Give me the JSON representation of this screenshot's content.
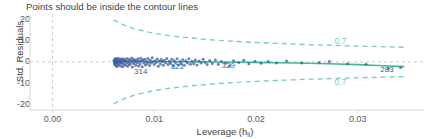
{
  "chart_data": {
    "type": "scatter",
    "title": "Points should be inside the contour lines",
    "xlabel_main": "Leverage (h",
    "xlabel_sub": "ii",
    "xlabel_close": ")",
    "xlabel": "Leverage (h_ii)",
    "ylabel": "Std. Residuals",
    "xlim": [
      -0.0022,
      0.0365
    ],
    "ylim": [
      -22.5,
      21.5
    ],
    "xticks": [
      0.0,
      0.01,
      0.02,
      0.03
    ],
    "xtick_labels": [
      "0.00",
      "0.01",
      "0.02",
      "0.03"
    ],
    "yticks": [
      20,
      10,
      0,
      -10,
      -20
    ],
    "ytick_labels": [
      "20",
      "10",
      "0",
      "-10",
      "-20"
    ],
    "grid": false,
    "legend": "none",
    "colors": {
      "point": "#3b5a9e",
      "smooth_line": "#3fbb93",
      "contour": "#7fcfb6",
      "reference_line": "#bdbdbd",
      "axis_text": "#5a5a5a",
      "background": "#ffffff"
    },
    "reference_lines": [
      {
        "orientation": "vertical",
        "value": 0.0,
        "style": "dashed",
        "color": "#c7c7c7"
      },
      {
        "orientation": "horizontal",
        "value": 0.0,
        "style": "dashed",
        "color": "#c7c7c7"
      }
    ],
    "annotations": [
      {
        "label": "0.7",
        "x": 0.0285,
        "y": 9.6,
        "color": "#7fcfb6"
      },
      {
        "label": "0.7",
        "x": 0.0285,
        "y": -9.6,
        "color": "#7fcfb6"
      },
      {
        "label": "314",
        "x": 0.0088,
        "y": -4.6,
        "color": "#3a5fa8"
      },
      {
        "label": "321",
        "x": 0.0124,
        "y": -2.3,
        "color": "#3a5fa8"
      },
      {
        "label": "329",
        "x": 0.0174,
        "y": -2.0,
        "color": "#3a5fa8"
      },
      {
        "label": "283",
        "x": 0.033,
        "y": -3.6,
        "color": "#3a5fa8"
      }
    ],
    "contours": {
      "label": "0.7",
      "style": "dashed",
      "upper": [
        [
          0.006,
          19.6
        ],
        [
          0.007,
          17.3
        ],
        [
          0.008,
          15.6
        ],
        [
          0.009,
          14.4
        ],
        [
          0.01,
          13.4
        ],
        [
          0.0115,
          12.3
        ],
        [
          0.013,
          11.5
        ],
        [
          0.0145,
          10.8
        ],
        [
          0.016,
          10.2
        ],
        [
          0.018,
          9.6
        ],
        [
          0.02,
          9.1
        ],
        [
          0.022,
          8.7
        ],
        [
          0.024,
          8.3
        ],
        [
          0.026,
          8.0
        ],
        [
          0.028,
          7.7
        ],
        [
          0.03,
          7.4
        ],
        [
          0.032,
          7.2
        ],
        [
          0.0345,
          6.9
        ]
      ],
      "lower": [
        [
          0.006,
          -19.6
        ],
        [
          0.007,
          -17.3
        ],
        [
          0.008,
          -15.6
        ],
        [
          0.009,
          -14.4
        ],
        [
          0.01,
          -13.4
        ],
        [
          0.0115,
          -12.3
        ],
        [
          0.013,
          -11.5
        ],
        [
          0.0145,
          -10.8
        ],
        [
          0.016,
          -10.2
        ],
        [
          0.018,
          -9.6
        ],
        [
          0.02,
          -9.1
        ],
        [
          0.022,
          -8.7
        ],
        [
          0.024,
          -8.3
        ],
        [
          0.026,
          -8.0
        ],
        [
          0.028,
          -7.7
        ],
        [
          0.03,
          -7.4
        ],
        [
          0.032,
          -7.2
        ],
        [
          0.0345,
          -6.9
        ]
      ]
    },
    "smooth_line": [
      [
        0.006,
        0.3
      ],
      [
        0.008,
        0.25
      ],
      [
        0.01,
        0.18
      ],
      [
        0.012,
        0.1
      ],
      [
        0.014,
        0.02
      ],
      [
        0.016,
        -0.05
      ],
      [
        0.018,
        -0.12
      ],
      [
        0.02,
        -0.22
      ],
      [
        0.022,
        -0.35
      ],
      [
        0.024,
        -0.5
      ],
      [
        0.026,
        -0.7
      ],
      [
        0.028,
        -0.95
      ],
      [
        0.03,
        -1.25
      ],
      [
        0.032,
        -1.65
      ],
      [
        0.0345,
        -2.2
      ]
    ],
    "points": [
      [
        0.00605,
        0.55
      ],
      [
        0.00608,
        -0.3
      ],
      [
        0.0061,
        1.1
      ],
      [
        0.00612,
        -1.2
      ],
      [
        0.00615,
        0.2
      ],
      [
        0.00618,
        -0.75
      ],
      [
        0.0062,
        1.6
      ],
      [
        0.00622,
        0.05
      ],
      [
        0.00625,
        -1.8
      ],
      [
        0.00628,
        0.9
      ],
      [
        0.0063,
        -0.4
      ],
      [
        0.00633,
        1.35
      ],
      [
        0.00636,
        -2.1
      ],
      [
        0.0064,
        0.45
      ],
      [
        0.00643,
        -0.95
      ],
      [
        0.00646,
        1.75
      ],
      [
        0.0065,
        0.1
      ],
      [
        0.00654,
        -1.45
      ],
      [
        0.00658,
        0.7
      ],
      [
        0.00662,
        -0.25
      ],
      [
        0.00666,
        1.2
      ],
      [
        0.0067,
        -1.95
      ],
      [
        0.00674,
        0.35
      ],
      [
        0.00678,
        -0.6
      ],
      [
        0.00682,
        1.5
      ],
      [
        0.00686,
        -0.1
      ],
      [
        0.0069,
        -2.3
      ],
      [
        0.00695,
        0.8
      ],
      [
        0.007,
        -1.05
      ],
      [
        0.00705,
        1.4
      ],
      [
        0.0071,
        0.25
      ],
      [
        0.00715,
        -1.6
      ],
      [
        0.0072,
        0.6
      ],
      [
        0.00726,
        -0.45
      ],
      [
        0.00732,
        1.65
      ],
      [
        0.00738,
        -2.0
      ],
      [
        0.00744,
        0.15
      ],
      [
        0.0075,
        -0.85
      ],
      [
        0.00756,
        1.25
      ],
      [
        0.00762,
        -1.35
      ],
      [
        0.00768,
        0.5
      ],
      [
        0.00774,
        -0.2
      ],
      [
        0.0078,
        1.85
      ],
      [
        0.00786,
        -2.4
      ],
      [
        0.00792,
        0.95
      ],
      [
        0.00798,
        -0.7
      ],
      [
        0.00805,
        1.15
      ],
      [
        0.00812,
        0.0
      ],
      [
        0.00819,
        -1.55
      ],
      [
        0.00826,
        0.65
      ],
      [
        0.00833,
        -0.35
      ],
      [
        0.0084,
        1.45
      ],
      [
        0.00847,
        -1.85
      ],
      [
        0.00854,
        0.3
      ],
      [
        0.00861,
        -1.0
      ],
      [
        0.00868,
        1.7
      ],
      [
        0.00875,
        0.4
      ],
      [
        0.00882,
        -2.2
      ],
      [
        0.0089,
        0.85
      ],
      [
        0.00898,
        -0.55
      ],
      [
        0.00906,
        1.3
      ],
      [
        0.00914,
        -1.4
      ],
      [
        0.00922,
        0.2
      ],
      [
        0.0093,
        -0.8
      ],
      [
        0.00938,
        1.55
      ],
      [
        0.00946,
        -0.15
      ],
      [
        0.00954,
        -1.7
      ],
      [
        0.00962,
        0.75
      ],
      [
        0.0097,
        -0.5
      ],
      [
        0.0098,
        1.9
      ],
      [
        0.0099,
        0.05
      ],
      [
        0.01,
        -1.25
      ],
      [
        0.0101,
        0.55
      ],
      [
        0.0102,
        -0.3
      ],
      [
        0.0103,
        1.35
      ],
      [
        0.0104,
        -2.05
      ],
      [
        0.0105,
        0.45
      ],
      [
        0.0106,
        -0.95
      ],
      [
        0.0107,
        1.1
      ],
      [
        0.0108,
        0.15
      ],
      [
        0.0109,
        -1.5
      ],
      [
        0.011,
        0.7
      ],
      [
        0.01112,
        -0.4
      ],
      [
        0.01124,
        1.6
      ],
      [
        0.01136,
        -1.15
      ],
      [
        0.01148,
        0.35
      ],
      [
        0.0116,
        -0.65
      ],
      [
        0.01172,
        1.25
      ],
      [
        0.01184,
        -1.9
      ],
      [
        0.01196,
        0.6
      ],
      [
        0.0121,
        -0.25
      ],
      [
        0.01224,
        1.45
      ],
      [
        0.01238,
        -1.3
      ],
      [
        0.01252,
        0.25
      ],
      [
        0.01266,
        -0.75
      ],
      [
        0.0128,
        1.05
      ],
      [
        0.01295,
        -1.6
      ],
      [
        0.0131,
        0.5
      ],
      [
        0.01325,
        -0.45
      ],
      [
        0.0134,
        1.5
      ],
      [
        0.01356,
        -1.05
      ],
      [
        0.01372,
        0.3
      ],
      [
        0.01388,
        -0.85
      ],
      [
        0.01404,
        0.95
      ],
      [
        0.0142,
        -1.45
      ],
      [
        0.0144,
        0.4
      ],
      [
        0.0146,
        -0.55
      ],
      [
        0.0148,
        1.2
      ],
      [
        0.015,
        -0.2
      ],
      [
        0.0152,
        -1.25
      ],
      [
        0.01545,
        0.65
      ],
      [
        0.0157,
        -0.7
      ],
      [
        0.016,
        0.9
      ],
      [
        0.0163,
        -1.1
      ],
      [
        0.0166,
        0.2
      ],
      [
        0.017,
        -0.5
      ],
      [
        0.0174,
        -1.95
      ],
      [
        0.0178,
        0.55
      ],
      [
        0.0183,
        -0.3
      ],
      [
        0.0188,
        0.75
      ],
      [
        0.0193,
        -0.9
      ],
      [
        0.0199,
        0.35
      ],
      [
        0.0205,
        -0.6
      ],
      [
        0.0212,
        0.15
      ],
      [
        0.022,
        -0.45
      ],
      [
        0.023,
        0.45
      ],
      [
        0.0245,
        -0.55
      ],
      [
        0.0262,
        -0.3
      ],
      [
        0.0272,
        0.25
      ],
      [
        0.029,
        -0.85
      ],
      [
        0.0308,
        -1.1
      ],
      [
        0.033,
        -3.1
      ],
      [
        0.0342,
        -2.6
      ]
    ]
  }
}
